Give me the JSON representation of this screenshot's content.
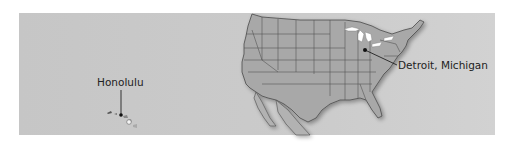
{
  "map": {
    "title": "United States locations",
    "background_color": "#c9c9c9",
    "land_color": "#a9a9a9",
    "border_color": "#4a4a4a",
    "lakes_color": "#ffffff",
    "markers": [
      {
        "label": "Honolulu",
        "region": "Hawaii",
        "marker": "dot-icon"
      },
      {
        "label": "Detroit, Michigan",
        "region": "Michigan",
        "marker": "dot-icon"
      }
    ]
  }
}
